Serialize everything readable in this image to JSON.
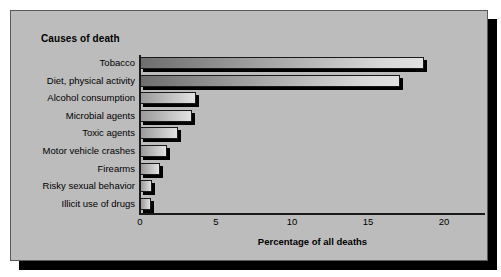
{
  "figure": {
    "background_color": "#bcbcbc",
    "frame_border_color": "#5a5a5a",
    "shadow_color": "#000000"
  },
  "chart_data": {
    "type": "bar",
    "orientation": "horizontal",
    "title": "Causes of death",
    "xlabel": "Percentage of all deaths",
    "ylabel": "",
    "xlim": [
      0,
      22.7
    ],
    "xticks": [
      0,
      5,
      10,
      15,
      20
    ],
    "xticklabels": [
      "0",
      "5",
      "10",
      "15",
      "20"
    ],
    "grid": false,
    "legend": false,
    "bar_fill": "gradient dark-gray to light-gray",
    "bar_edge_color": "#1a1a1a",
    "bar_shadow_color": "#000000",
    "categories": [
      "Tobacco",
      "Diet, physical activity",
      "Alcohol consumption",
      "Microbial agents",
      "Toxic agents",
      "Motor vehicle crashes",
      "Firearms",
      "Risky sexual behavior",
      "Illicit use of drugs"
    ],
    "values": [
      18.7,
      17.1,
      3.7,
      3.4,
      2.5,
      1.8,
      1.3,
      0.8,
      0.7
    ],
    "series": [
      {
        "name": "Percentage of all deaths",
        "values": [
          18.7,
          17.1,
          3.7,
          3.4,
          2.5,
          1.8,
          1.3,
          0.8,
          0.7
        ]
      }
    ]
  }
}
